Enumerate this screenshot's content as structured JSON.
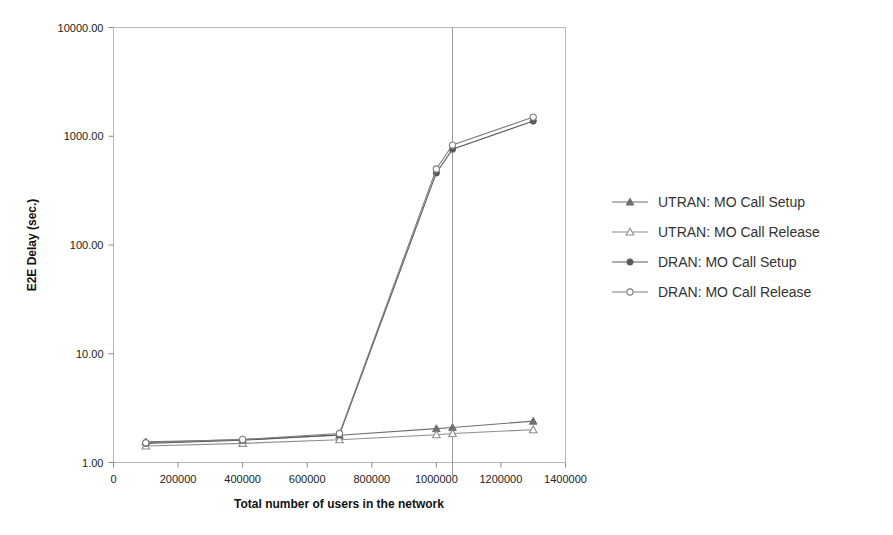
{
  "chart_data": {
    "type": "line",
    "title": "",
    "xlabel": "Total number of users in the network",
    "ylabel": "E2E Delay (sec.)",
    "yscale": "log",
    "xlim": [
      0,
      1400000
    ],
    "ylim": [
      1.0,
      10000.0
    ],
    "grid": false,
    "legend_position": "right",
    "x_ticks": [
      0,
      200000,
      400000,
      600000,
      800000,
      1000000,
      1200000,
      1400000
    ],
    "x_tick_labels": [
      "0",
      "200000",
      "400000",
      "600000",
      "800000",
      "1000000",
      "1200000",
      "1400000"
    ],
    "y_ticks": [
      1.0,
      10.0,
      100.0,
      1000.0,
      10000.0
    ],
    "y_tick_labels": [
      "1.00",
      "10.00",
      "100.00",
      "1000.00",
      "10000.00"
    ],
    "x": [
      100000,
      400000,
      700000,
      1000000,
      1050000,
      1300000
    ],
    "annotations": [
      {
        "type": "vertical-reference-line",
        "x": 1050000,
        "label": ""
      }
    ],
    "series": [
      {
        "name": "UTRAN: MO Call Setup",
        "marker": "triangle-filled",
        "color": "#6f6f6f",
        "values": [
          1.55,
          1.62,
          1.78,
          2.05,
          2.1,
          2.4
        ]
      },
      {
        "name": "UTRAN: MO Call Release",
        "marker": "triangle-open",
        "color": "#8e8e8e",
        "values": [
          1.42,
          1.5,
          1.62,
          1.8,
          1.85,
          2.0
        ]
      },
      {
        "name": "DRAN: MO Call Setup",
        "marker": "circle-filled",
        "color": "#5a5a5a",
        "values": [
          1.5,
          1.6,
          1.8,
          460.0,
          760.0,
          1380.0
        ]
      },
      {
        "name": "DRAN: MO Call Release",
        "marker": "circle-open",
        "color": "#7d7d7d",
        "values": [
          1.52,
          1.63,
          1.85,
          500.0,
          830.0,
          1500.0
        ]
      }
    ]
  },
  "legend": {
    "entries": [
      {
        "label": "UTRAN: MO Call Setup",
        "marker": "triangle-filled"
      },
      {
        "label": "UTRAN: MO Call Release",
        "marker": "triangle-open"
      },
      {
        "label": "DRAN: MO Call Setup",
        "marker": "circle-filled"
      },
      {
        "label": "DRAN: MO Call Release",
        "marker": "circle-open"
      }
    ]
  },
  "colors": {
    "axis": "#b9b9b9",
    "text": "#222222",
    "refline": "#9a9a9a",
    "background": "#ffffff"
  }
}
